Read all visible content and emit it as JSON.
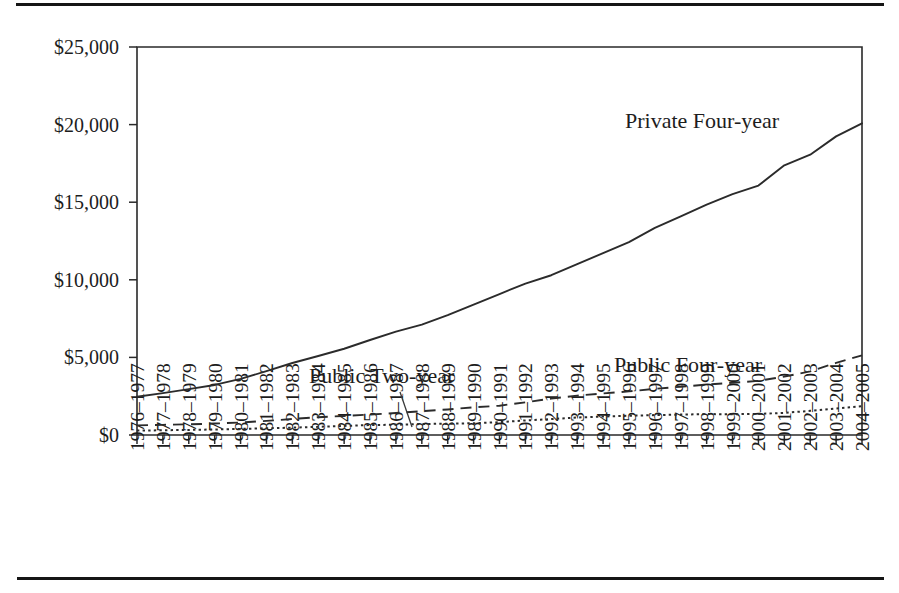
{
  "figure": {
    "has_top_rule": true,
    "has_bottom_rule": true,
    "background": "#ffffff",
    "ink": "#2b2b2b"
  },
  "chart_data": {
    "type": "line",
    "title": "",
    "subtitle": "",
    "xlabel": "",
    "ylabel": "",
    "grid": false,
    "legend_position": "inline-annotations",
    "ylim": [
      0,
      25000
    ],
    "ytick_values": [
      0,
      5000,
      10000,
      15000,
      20000,
      25000
    ],
    "ytick_labels": [
      "$0",
      "$5,000",
      "$10,000",
      "$15,000",
      "$20,000",
      "$25,000"
    ],
    "categories": [
      "1976–1977",
      "1977–1978",
      "1978–1979",
      "1979–1980",
      "1980–1981",
      "1981–1982",
      "1982–1983",
      "1983–1984",
      "1984–1985",
      "1985–1986",
      "1986–1987",
      "1987–1988",
      "1988–1989",
      "1989–1990",
      "1990–1991",
      "1991–1992",
      "1992–1993",
      "1993–1994",
      "1994–1995",
      "1995–1996",
      "1996–1997",
      "1997–1998",
      "1998–1999",
      "1999–2000",
      "2000–2001",
      "2001–2002",
      "2002–2003",
      "2003–2004",
      "2004–2005"
    ],
    "series": [
      {
        "name": "Private Four-year",
        "style": "solid",
        "label_text": "Private Four-year",
        "values": [
          2467,
          2700,
          2958,
          3225,
          3617,
          4113,
          4639,
          5093,
          5556,
          6121,
          6658,
          7116,
          7722,
          8396,
          9083,
          9759,
          10294,
          11007,
          11719,
          12432,
          13344,
          14088,
          14846,
          15518,
          16072,
          17377,
          18060,
          19241,
          20082
        ]
      },
      {
        "name": "Public Four-year",
        "style": "dashed",
        "label_text": "Public Four-year",
        "values": [
          617,
          655,
          688,
          738,
          804,
          909,
          1031,
          1148,
          1228,
          1318,
          1414,
          1537,
          1646,
          1781,
          1888,
          2107,
          2349,
          2535,
          2681,
          2811,
          2975,
          3110,
          3247,
          3362,
          3487,
          3766,
          4098,
          4645,
          5132
        ]
      },
      {
        "name": "Public Two-year",
        "style": "dotted",
        "label_text": "Public Two-year",
        "values": [
          283,
          306,
          327,
          355,
          391,
          434,
          473,
          528,
          584,
          641,
          660,
          706,
          730,
          756,
          824,
          936,
          1025,
          1125,
          1192,
          1239,
          1283,
          1314,
          1348,
          1338,
          1359,
          1425,
          1557,
          1713,
          1849
        ]
      }
    ],
    "annotations": [
      {
        "text": "Private Four-year",
        "series": "Private Four-year",
        "x": 625,
        "y": 128,
        "leader": false
      },
      {
        "text": "Public Two-year",
        "series": "Public Two-year",
        "x": 309,
        "y": 383,
        "leader": true,
        "leader_from": [
          400,
          392
        ],
        "leader_to": [
          412,
          427
        ]
      },
      {
        "text": "Public Four-year",
        "series": "Public Four-year",
        "x": 614,
        "y": 372,
        "leader": false
      }
    ]
  }
}
